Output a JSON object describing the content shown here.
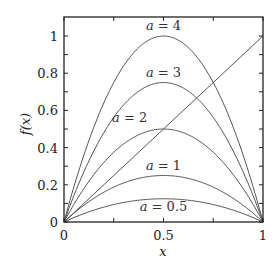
{
  "chart_data": {
    "type": "line",
    "title": "",
    "xlabel": "x",
    "ylabel": "f(x)",
    "xlim": [
      0,
      1
    ],
    "ylim": [
      0,
      1.1
    ],
    "xticks": [
      0,
      0.5,
      1
    ],
    "xtick_labels": [
      "0",
      "0.5",
      "1"
    ],
    "yticks": [
      0,
      0.2,
      0.4,
      0.6,
      0.8,
      1
    ],
    "ytick_labels": [
      "0",
      "0.2",
      "0.4",
      "0.6",
      "0.8",
      "1"
    ],
    "grid": false,
    "legend": "inline labels",
    "function": "f(x) = a x (1 - x)",
    "series": [
      {
        "name": "a = 4",
        "a": 4,
        "peak": 1.0
      },
      {
        "name": "a = 3",
        "a": 3,
        "peak": 0.75
      },
      {
        "name": "a = 2",
        "a": 2,
        "peak": 0.5
      },
      {
        "name": "a = 1",
        "a": 1,
        "peak": 0.25
      },
      {
        "name": "a = 0.5",
        "a": 0.5,
        "peak": 0.125
      },
      {
        "name": "y = x",
        "diagonal": true
      }
    ],
    "annotations": [
      {
        "text": "a = 4",
        "x": 0.5,
        "y": 1.03
      },
      {
        "text": "a = 3",
        "x": 0.5,
        "y": 0.78
      },
      {
        "text": "a = 2",
        "x": 0.33,
        "y": 0.54
      },
      {
        "text": "a = 1",
        "x": 0.5,
        "y": 0.28
      },
      {
        "text": "a = 0.5",
        "x": 0.5,
        "y": 0.06
      }
    ],
    "line_color": "#555555"
  }
}
